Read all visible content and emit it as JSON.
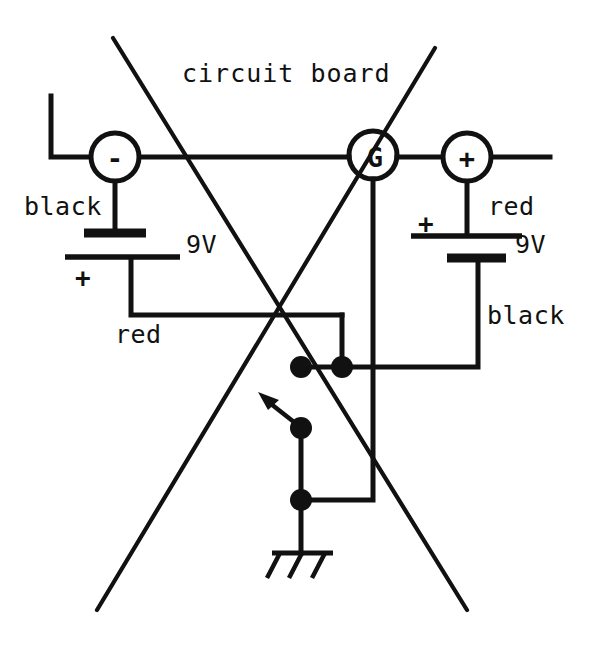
{
  "diagram": {
    "title": "circuit board",
    "title_pos": {
      "x": 182,
      "y": 82
    },
    "background": "#ffffff",
    "ink_color": "#111111",
    "width": 604,
    "height": 646
  },
  "terminals": [
    {
      "id": "minus",
      "label": "-",
      "cx": 115,
      "cy": 157,
      "r": 24
    },
    {
      "id": "ground-g",
      "label": "G",
      "cx": 373,
      "cy": 155,
      "r": 24
    },
    {
      "id": "plus",
      "label": "+",
      "cx": 467,
      "cy": 157,
      "r": 24
    }
  ],
  "batteries": [
    {
      "id": "left-battery",
      "voltage": "9V",
      "voltage_pos": {
        "x": 186,
        "y": 253
      },
      "lead_top_label": "black",
      "lead_top_label_pos": {
        "x": 24,
        "y": 215
      },
      "lead_bottom_label": "red",
      "lead_bottom_label_pos": {
        "x": 115,
        "y": 343
      },
      "polarity_symbol": "+",
      "polarity_symbol_pos": {
        "x": 75,
        "y": 287
      }
    },
    {
      "id": "right-battery",
      "voltage": "9V",
      "voltage_pos": {
        "x": 515,
        "y": 253
      },
      "lead_top_label": "red",
      "lead_top_label_pos": {
        "x": 488,
        "y": 215
      },
      "lead_bottom_label": "black",
      "lead_bottom_label_pos": {
        "x": 487,
        "y": 324
      },
      "polarity_symbol": "+",
      "polarity_symbol_pos": {
        "x": 418,
        "y": 233
      }
    }
  ],
  "junction_dots": [
    {
      "id": "dot-red-node",
      "cx": 301,
      "cy": 367,
      "r": 11
    },
    {
      "id": "dot-black-node",
      "cx": 342,
      "cy": 367,
      "r": 11
    },
    {
      "id": "dot-switch-pivot",
      "cx": 301,
      "cy": 428,
      "r": 11
    },
    {
      "id": "dot-ground-node",
      "cx": 301,
      "cy": 500,
      "r": 11
    }
  ],
  "switch": {
    "id": "toggle-switch",
    "pivot": {
      "x": 301,
      "y": 428
    },
    "lever_tip": {
      "x": 264,
      "y": 398
    },
    "arrow_tip": {
      "x": 258,
      "y": 393
    }
  },
  "ground_symbol": {
    "id": "chassis-ground",
    "stem_x": 301,
    "stem_top_y": 500,
    "bar_y": 553,
    "bar_x1": 274,
    "bar_x2": 332,
    "legs": 3
  },
  "strikethrough": {
    "note": "two crossing lines drawn over the schematic",
    "line_a": {
      "x1": 113,
      "y1": 38,
      "x2": 467,
      "y2": 610
    },
    "line_b": {
      "x1": 435,
      "y1": 48,
      "x2": 97,
      "y2": 610
    }
  },
  "wires": {
    "left_top_riser": {
      "x": 51,
      "y_top": 96,
      "y_bottom": 157
    },
    "bus_y": 157,
    "bus_x_left": 51,
    "bus_x_right": 550,
    "g_drop_x": 373,
    "g_drop_bottom": 500,
    "red_run_y": 315,
    "red_run_x_left": 131,
    "red_run_x_right": 342,
    "black_run_y": 367,
    "black_run_x_left": 342,
    "black_run_x_right": 478
  }
}
